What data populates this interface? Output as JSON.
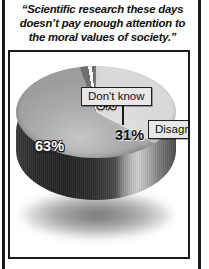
{
  "figure": {
    "title": "“Scientific research these days doesn’t pay enough attention to the moral values of society.”",
    "title_lines": [
      "“Scientific research these days",
      "doesn’t pay enough attention to",
      "the moral values of society.”"
    ]
  },
  "callouts": {
    "dont_know": "Don't know",
    "disagree": "Disagree",
    "agree": "Agree"
  },
  "chart_data": {
    "type": "pie",
    "title": "“Scientific research these days doesn’t pay enough attention to the moral values of society.”",
    "xlabel": "",
    "ylabel": "",
    "categories": [
      "Agree",
      "Disagree",
      "Don't know"
    ],
    "values": [
      63,
      31,
      6
    ],
    "value_labels": [
      "63%",
      "31%",
      "6%"
    ],
    "units": "percent",
    "legend": "callout-labels",
    "legend_position": "attached-to-slices",
    "grid": false,
    "three_d": true,
    "exploded_slice": "Disagree",
    "colors": {
      "agree": "#9d9d9d",
      "disagree": "#d9d9d9",
      "dont_know": "#6f6f6f",
      "side_wall_dark": "#262626",
      "outline": "#1a1a1a",
      "callout_fill": "#e8e8e8",
      "background": "#ffffff"
    }
  }
}
